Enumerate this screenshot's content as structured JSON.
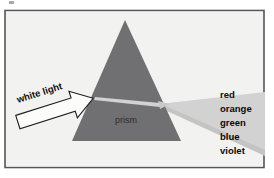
{
  "figure": {
    "background_color": "#ffffff",
    "panel_color": "#f1f1ef",
    "frame_color": "#55565a",
    "prism": {
      "label": "prism",
      "fill_color": "#706f71",
      "apex": [
        125,
        20
      ],
      "base_left": [
        72,
        141
      ],
      "base_right": [
        181,
        141
      ]
    },
    "incident_beam": {
      "label": "white light",
      "fill_color": "#fcfcfa",
      "outline_color": "#1c1c1c",
      "rotation_deg": -18
    },
    "dispersed_beam": {
      "fill_color": "#d2d2d2",
      "edge_color": "#8e8e8e"
    },
    "spectrum_labels": [
      "red",
      "orange",
      "green",
      "blue",
      "violet"
    ]
  }
}
